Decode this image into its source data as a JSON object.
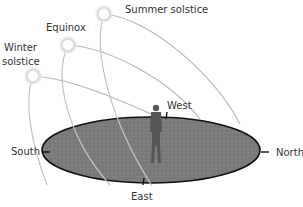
{
  "diagram": {
    "sun_paths": [
      {
        "id": "summer",
        "label": "Summer solstice"
      },
      {
        "id": "equinox",
        "label": "Equinox"
      },
      {
        "id": "winter",
        "label_line1": "Winter",
        "label_line2": "solstice"
      }
    ],
    "directions": {
      "west": "West",
      "south": "South",
      "north": "North",
      "east": "East"
    },
    "colors": {
      "ground": "#7a7a7a",
      "ground_outline": "#111111",
      "arc": "#b8b8b8",
      "sun_glow": "#c8c8c8",
      "person": "#555555",
      "text": "#333333"
    }
  }
}
